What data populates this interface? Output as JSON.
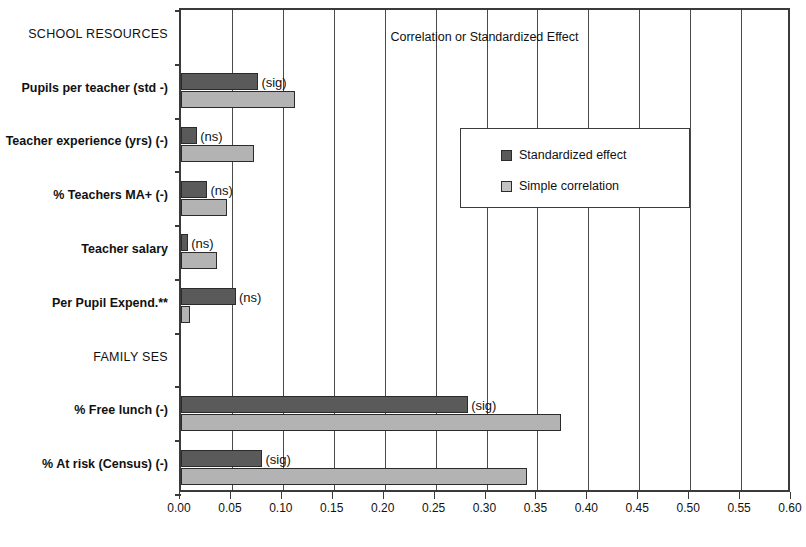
{
  "chart_data": {
    "type": "bar",
    "orientation": "horizontal",
    "title": "",
    "xlabel": "Correlation or Standardized Effect",
    "ylabel": "",
    "xlim": [
      0.0,
      0.6
    ],
    "xticks": [
      "0.00",
      "0.05",
      "0.10",
      "0.15",
      "0.20",
      "0.25",
      "0.30",
      "0.35",
      "0.40",
      "0.45",
      "0.50",
      "0.55",
      "0.60"
    ],
    "xtick_values": [
      0.0,
      0.05,
      0.1,
      0.15,
      0.2,
      0.25,
      0.3,
      0.35,
      0.4,
      0.45,
      0.5,
      0.55,
      0.6
    ],
    "grid": true,
    "legend_position": "upper right inside",
    "categories": [
      "SCHOOL RESOURCES",
      "Pupils per teacher (std -)",
      "Teacher experience (yrs) (-)",
      "% Teachers MA+ (-)",
      "Teacher salary",
      "Per Pupil Expend.**",
      "FAMILY SES",
      "% Free lunch (-)",
      "% At risk (Census) (-)"
    ],
    "series": [
      {
        "name": "Standardized effect",
        "color": "#5a5a5a",
        "values": [
          null,
          0.076,
          0.016,
          0.026,
          0.007,
          0.054,
          null,
          0.282,
          0.08
        ]
      },
      {
        "name": "Simple correlation",
        "color": "#b3b3b3",
        "values": [
          null,
          0.112,
          0.072,
          0.045,
          0.035,
          0.009,
          null,
          0.373,
          0.34
        ]
      }
    ],
    "annotations": [
      {
        "category": "Pupils per teacher (std -)",
        "text": "(sig)"
      },
      {
        "category": "Teacher experience (yrs) (-)",
        "text": "(ns)"
      },
      {
        "category": "% Teachers MA+ (-)",
        "text": "(ns)"
      },
      {
        "category": "Teacher salary",
        "text": "(ns)"
      },
      {
        "category": "Per Pupil Expend.**",
        "text": "(ns)"
      },
      {
        "category": "% Free lunch (-)",
        "text": "(sig)"
      },
      {
        "category": "% At risk (Census) (-)",
        "text": "(sig)"
      }
    ],
    "group_headers": [
      "SCHOOL RESOURCES",
      "FAMILY SES"
    ]
  },
  "legend": {
    "items": [
      {
        "label": "Standardized effect",
        "swatch": "dark"
      },
      {
        "label": "Simple correlation",
        "swatch": "light"
      }
    ]
  },
  "axis": {
    "x_title": "Correlation or Standardized Effect"
  }
}
